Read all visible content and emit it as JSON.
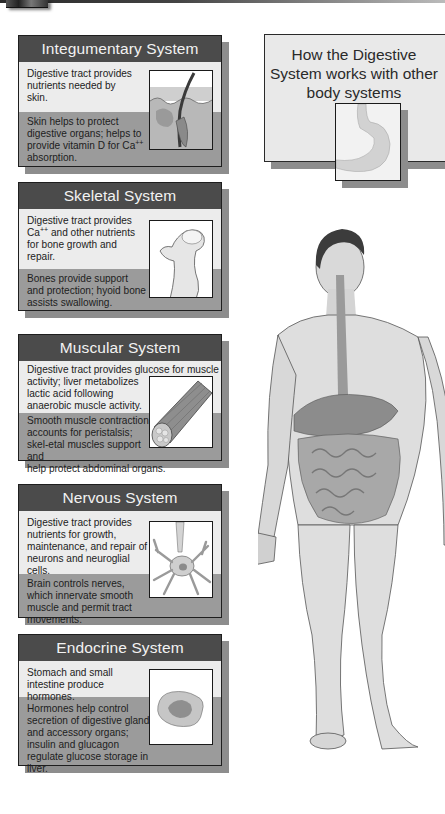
{
  "header": {
    "title_lines": [
      "How the Digestive",
      "System works with other",
      "body systems"
    ],
    "title_image": "stomach-illustration"
  },
  "systems": [
    {
      "name": "Integumentary System",
      "digestive_to_system": "Digestive tract provides nutrients needed by skin.",
      "system_to_digestive_parts": [
        "Skin helps to protect digestive organs; helps to provide vitamin D for Ca",
        "++",
        " absorption."
      ],
      "image": "skin-hair-follicle-illustration"
    },
    {
      "name": "Skeletal System",
      "digestive_to_system_parts": [
        "Digestive tract provides Ca",
        "++",
        " and other nutrients for bone growth and repair."
      ],
      "system_to_digestive": "Bones provide support and protection; hyoid bone assists swallowing.",
      "image": "bone-femur-illustration"
    },
    {
      "name": "Muscular System",
      "digestive_to_system_line1": "Digestive tract provides glucose for muscle",
      "digestive_to_system_rest": "activity; liver metabolizes lactic acid following anaerobic muscle activity.",
      "system_to_digestive": "Smooth muscle contraction accounts for peristalsis; skel-etal muscles support and",
      "system_to_digestive_last": "help protect abdominal organs.",
      "image": "muscle-fiber-bundle-illustration"
    },
    {
      "name": "Nervous System",
      "digestive_to_system": "Digestive tract provides nutrients for growth, maintenance, and repair of neurons and neuroglial cells.",
      "system_to_digestive": "Brain controls nerves, which innervate smooth muscle and permit tract movements.",
      "image": "neuron-illustration"
    },
    {
      "name": "Endocrine System",
      "digestive_to_system": "Stomach and small intestine produce hormones.",
      "system_to_digestive": "Hormones help control secretion of digestive glands and accessory organs; insulin and glucagon regulate glucose storage in liver.",
      "image": "pancreas-islet-illustration"
    }
  ],
  "figure": {
    "image": "human-body-digestive-system-illustration"
  },
  "colors": {
    "title_bar": "#4b4b4b",
    "top_panel": "#ececec",
    "bottom_panel": "#9b9b9b",
    "shadow": "#8d8d8d"
  }
}
